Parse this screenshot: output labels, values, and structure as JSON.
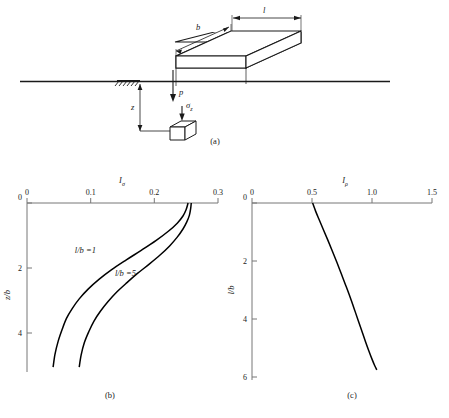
{
  "figure": {
    "panels": [
      {
        "id": "a",
        "caption": "(a)"
      },
      {
        "id": "b",
        "caption": "(b)"
      },
      {
        "id": "c",
        "caption": "(c)"
      }
    ]
  },
  "panel_a": {
    "caption": "(a)",
    "dim_b_label": "b",
    "dim_l_label": "l",
    "pressure_label": "p",
    "stress_label": "σ",
    "stress_sub": "z",
    "depth_label": "z",
    "hatch_icon": "ground-hatch-icon"
  },
  "chart_data": [
    {
      "panel": "b",
      "type": "line",
      "title": "I",
      "title_sub": "σ",
      "xlabel": "Iσ",
      "ylabel": "z/b",
      "xlim": [
        0,
        0.3
      ],
      "ylim": [
        0,
        5.2
      ],
      "xticks": [
        0,
        0.1,
        0.2,
        0.3
      ],
      "xticklabels": [
        "0",
        "0.1",
        "0.2",
        "0.3"
      ],
      "yticks": [
        0,
        2,
        4
      ],
      "yticklabels": [
        "0",
        "2",
        "4"
      ],
      "grid": false,
      "y_axis_inverted": true,
      "legend": "inline-annotations",
      "series": [
        {
          "name": "l/b =1",
          "annotation": "l/b =1",
          "annotation_at": {
            "x": 0.075,
            "y": 1.55
          },
          "x": [
            0.253,
            0.25,
            0.245,
            0.236,
            0.222,
            0.203,
            0.18,
            0.156,
            0.133,
            0.113,
            0.096,
            0.082,
            0.071,
            0.062,
            0.055,
            0.049,
            0.044,
            0.041
          ],
          "y": [
            0.0,
            0.2,
            0.4,
            0.62,
            0.87,
            1.15,
            1.45,
            1.75,
            2.05,
            2.35,
            2.65,
            2.95,
            3.25,
            3.55,
            3.9,
            4.25,
            4.65,
            5.05
          ]
        },
        {
          "name": "l/b =5",
          "annotation": "l/b =5",
          "annotation_at": {
            "x": 0.138,
            "y": 2.25
          },
          "x": [
            0.258,
            0.257,
            0.255,
            0.251,
            0.245,
            0.236,
            0.224,
            0.209,
            0.192,
            0.174,
            0.157,
            0.141,
            0.127,
            0.115,
            0.105,
            0.097,
            0.09,
            0.085,
            0.082
          ],
          "y": [
            0.0,
            0.18,
            0.38,
            0.58,
            0.8,
            1.05,
            1.32,
            1.6,
            1.88,
            2.16,
            2.45,
            2.74,
            3.04,
            3.34,
            3.64,
            3.96,
            4.3,
            4.68,
            5.05
          ]
        }
      ]
    },
    {
      "panel": "c",
      "type": "line",
      "title": "I",
      "title_sub": "ρ",
      "xlabel": "Iρ",
      "ylabel": "l/b",
      "xlim": [
        0,
        1.5
      ],
      "ylim": [
        0,
        6.1
      ],
      "xticks": [
        0,
        0.5,
        1.0,
        1.5
      ],
      "xticklabels": [
        "0",
        "0.5",
        "1.0",
        "1.5"
      ],
      "yticks": [
        0,
        2,
        4,
        6
      ],
      "yticklabels": [
        "0",
        "2",
        "4",
        "6"
      ],
      "grid": false,
      "y_axis_inverted": true,
      "series": [
        {
          "name": "influence-factor-rho",
          "x": [
            0.505,
            0.53,
            0.56,
            0.595,
            0.632,
            0.67,
            0.708,
            0.745,
            0.782,
            0.818,
            0.852,
            0.885,
            0.916,
            0.946,
            0.974,
            1.0,
            1.022,
            1.04
          ],
          "y": [
            0.0,
            0.28,
            0.58,
            0.92,
            1.28,
            1.66,
            2.05,
            2.45,
            2.85,
            3.25,
            3.65,
            4.05,
            4.42,
            4.78,
            5.1,
            5.38,
            5.6,
            5.75
          ]
        }
      ]
    }
  ],
  "colors": {
    "ink": "#1a1a1a",
    "axis": "#555555",
    "curve": "#000000",
    "fill": "#ffffff"
  }
}
